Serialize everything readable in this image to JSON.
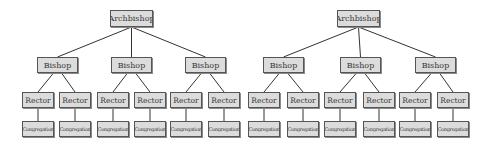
{
  "diagram": {
    "type": "organizational-hierarchy",
    "colors": {
      "box_fill": "#dcdcdc",
      "box_border": "#555555",
      "edge": "#333333",
      "text": "#3a3a3a",
      "background": "#ffffff"
    },
    "labels": {
      "archbishop": "Archbishop",
      "bishop": "Bishop",
      "rector": "Rector",
      "congregation": "Congregation"
    },
    "trees": [
      {
        "root": {
          "label": "Archbishop",
          "box": [
            110,
            10,
            43,
            17
          ]
        },
        "bishops": [
          {
            "label": "Bishop",
            "box": [
              37,
              57,
              41,
              16
            ],
            "rectors": [
              {
                "label": "Rector",
                "box": [
                  22,
                  92,
                  32,
                  16
                ],
                "congregation": {
                  "label": "Congregation",
                  "box": [
                    22,
                    121,
                    32,
                    16
                  ]
                }
              },
              {
                "label": "Rector",
                "box": [
                  59,
                  92,
                  32,
                  16
                ],
                "congregation": {
                  "label": "Congregation",
                  "box": [
                    59,
                    121,
                    32,
                    16
                  ]
                }
              }
            ]
          },
          {
            "label": "Bishop",
            "box": [
              111,
              57,
              41,
              16
            ],
            "rectors": [
              {
                "label": "Rector",
                "box": [
                  97,
                  92,
                  32,
                  16
                ],
                "congregation": {
                  "label": "Congregation",
                  "box": [
                    97,
                    121,
                    32,
                    16
                  ]
                }
              },
              {
                "label": "Rector",
                "box": [
                  134,
                  92,
                  32,
                  16
                ],
                "congregation": {
                  "label": "Congregation",
                  "box": [
                    134,
                    121,
                    32,
                    16
                  ]
                }
              }
            ]
          },
          {
            "label": "Bishop",
            "box": [
              185,
              57,
              41,
              16
            ],
            "rectors": [
              {
                "label": "Rector",
                "box": [
                  170,
                  92,
                  32,
                  16
                ],
                "congregation": {
                  "label": "Congregation",
                  "box": [
                    170,
                    121,
                    32,
                    16
                  ]
                }
              },
              {
                "label": "Rector",
                "box": [
                  208,
                  92,
                  32,
                  16
                ],
                "congregation": {
                  "label": "Congregation",
                  "box": [
                    208,
                    121,
                    32,
                    16
                  ]
                }
              }
            ]
          }
        ]
      },
      {
        "root": {
          "label": "Archbishop",
          "box": [
            337,
            10,
            43,
            17
          ]
        },
        "bishops": [
          {
            "label": "Bishop",
            "box": [
              263,
              57,
              41,
              16
            ],
            "rectors": [
              {
                "label": "Rector",
                "box": [
                  248,
                  92,
                  32,
                  16
                ],
                "congregation": {
                  "label": "Congregation",
                  "box": [
                    248,
                    121,
                    32,
                    16
                  ]
                }
              },
              {
                "label": "Rector",
                "box": [
                  287,
                  92,
                  32,
                  16
                ],
                "congregation": {
                  "label": "Congregation",
                  "box": [
                    287,
                    121,
                    32,
                    16
                  ]
                }
              }
            ]
          },
          {
            "label": "Bishop",
            "box": [
              340,
              57,
              41,
              16
            ],
            "rectors": [
              {
                "label": "Rector",
                "box": [
                  324,
                  92,
                  32,
                  16
                ],
                "congregation": {
                  "label": "Congregation",
                  "box": [
                    324,
                    121,
                    32,
                    16
                  ]
                }
              },
              {
                "label": "Rector",
                "box": [
                  363,
                  92,
                  32,
                  16
                ],
                "congregation": {
                  "label": "Congregation",
                  "box": [
                    363,
                    121,
                    32,
                    16
                  ]
                }
              }
            ]
          },
          {
            "label": "Bishop",
            "box": [
              415,
              57,
              41,
              16
            ],
            "rectors": [
              {
                "label": "Rector",
                "box": [
                  399,
                  92,
                  32,
                  16
                ],
                "congregation": {
                  "label": "Congregation",
                  "box": [
                    399,
                    121,
                    32,
                    16
                  ]
                }
              },
              {
                "label": "Rector",
                "box": [
                  437,
                  92,
                  32,
                  16
                ],
                "congregation": {
                  "label": "Congregation",
                  "box": [
                    437,
                    121,
                    32,
                    16
                  ]
                }
              }
            ]
          }
        ]
      }
    ]
  }
}
